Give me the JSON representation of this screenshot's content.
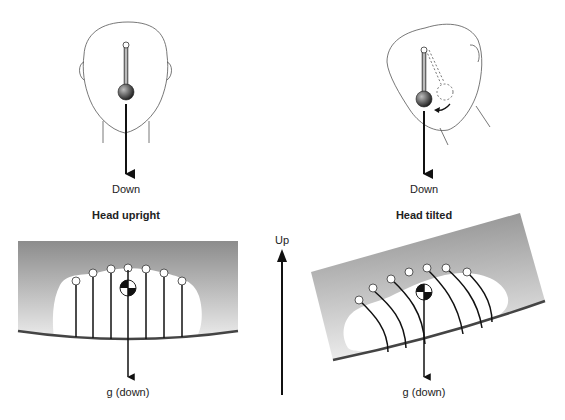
{
  "panels": {
    "left": {
      "title": "Head upright",
      "head_arrow_label": "Down",
      "gravity_label": "g (down)"
    },
    "right": {
      "title": "Head tilted",
      "head_arrow_label": "Down",
      "gravity_label": "g (down)"
    }
  },
  "center_axis": {
    "label": "Up"
  },
  "colors": {
    "stroke": "#1a1a1a",
    "gel_dark": "#8a8a8a",
    "gel_light": "#f2f2f2",
    "membrane": "#444444"
  }
}
